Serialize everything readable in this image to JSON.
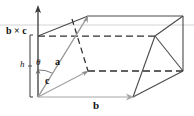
{
  "figure": {
    "type": "vector-diagram",
    "background_color": "#ffffff",
    "stroke_color": "#3a3a3a",
    "light_stroke_color": "#b0b0b0",
    "vector_color": "#9a9a9a",
    "labels": {
      "normal_vector": "b × c",
      "height": "h",
      "angle": "θ",
      "vector_a": "a",
      "vector_c": "c",
      "vector_b": "b"
    },
    "icons": {
      "up_arrow": "up-arrow-icon",
      "right_arrow": "right-arrow-icon",
      "height_bracket": "height-bracket-icon"
    },
    "geometry": {
      "origin": [
        38,
        97
      ],
      "b_tip": [
        133,
        97
      ],
      "a_tip": [
        88,
        16
      ],
      "c_tip": [
        88,
        71
      ],
      "axis_top": [
        38,
        6
      ],
      "top_guide_y": 25,
      "dashed_top_y": 36,
      "vertices": {
        "front_bottom_left": [
          38,
          97
        ],
        "front_bottom_right": [
          133,
          97
        ],
        "front_top_left": [
          88,
          16
        ],
        "front_top_right": [
          183,
          16
        ],
        "back_bottom_left": [
          88,
          71
        ],
        "back_bottom_right": [
          183,
          71
        ],
        "back_top_left": [
          38,
          36
        ],
        "back_top_right": [
          155,
          36
        ]
      }
    }
  }
}
